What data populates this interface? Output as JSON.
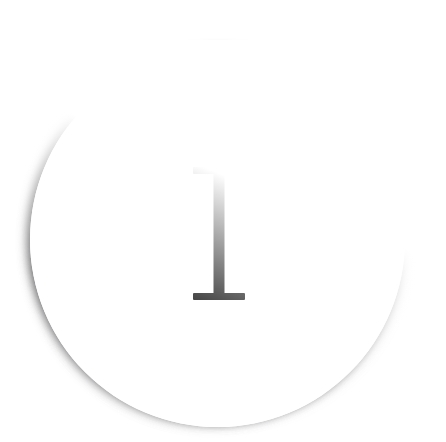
{
  "canvas": {
    "width": 446,
    "height": 404,
    "background_color": "#ffffff"
  },
  "badge": {
    "name": "circular-badge",
    "shape": "circle",
    "fill_color": "#ffffff",
    "diameter_px": 375,
    "center_x": 217,
    "center_y": 239,
    "shadow": {
      "color": "#464648",
      "direction": "top-left",
      "description": "soft grey drop shadow strongest along the upper arc, fading to none at bottom-right"
    }
  },
  "glyph": {
    "name": "letter-i-glyph",
    "character": "I",
    "color": "#121212",
    "style": "serif capital with flat slab serifs",
    "height_px": 133,
    "serif_width_px": 52,
    "stem_width_px": 11
  }
}
